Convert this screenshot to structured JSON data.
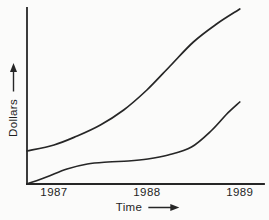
{
  "figure": {
    "background_color": "#fbfbfa",
    "ink_color": "#262626",
    "text_color": "#1f1f1f"
  },
  "chart_data": {
    "type": "line",
    "title": "",
    "xlabel": "Time",
    "ylabel": "Dollars",
    "x_ticks": [
      "1987",
      "1988",
      "1989"
    ],
    "x_tick_positions": [
      1987,
      1988,
      1989
    ],
    "xlim": [
      1986.71,
      1989.26
    ],
    "ylim": [
      0,
      176
    ],
    "grid": false,
    "legend_position": "none",
    "axis_arrows": {
      "x": "right",
      "y": "up"
    },
    "series": [
      {
        "name": "upper-curve",
        "x": [
          1986.71,
          1987.0,
          1987.25,
          1987.5,
          1987.75,
          1988.0,
          1988.25,
          1988.5,
          1988.75,
          1989.0
        ],
        "y": [
          33,
          39,
          48,
          59,
          74,
          94,
          118,
          142,
          160,
          175
        ]
      },
      {
        "name": "lower-curve",
        "x": [
          1986.71,
          1986.92,
          1987.14,
          1987.36,
          1987.58,
          1987.8,
          1988.01,
          1988.23,
          1988.48,
          1988.7,
          1988.86,
          1989.0
        ],
        "y": [
          0,
          7,
          15,
          20,
          22,
          23,
          25,
          29,
          37,
          54,
          70,
          82
        ]
      }
    ]
  }
}
